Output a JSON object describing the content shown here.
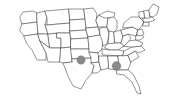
{
  "figure": {
    "kind": "us-state-map",
    "title": "",
    "background_color": "#ffffff",
    "width": 174,
    "height": 103
  },
  "map": {
    "outline_color": "#2e2e2e",
    "state_border_color": "#3a3a3a",
    "state_fill_color": "#ffffff",
    "boundary_style": "state-outlines"
  },
  "markers": [
    {
      "id": "marker-1",
      "name": "oklahoma-marker",
      "label": "",
      "x": 81,
      "y": 60,
      "radius": 4.2,
      "color": "#8a8a8a",
      "shape": "circle"
    },
    {
      "id": "marker-2",
      "name": "alabama-marker",
      "label": "",
      "x": 116.5,
      "y": 66,
      "radius": 4.4,
      "color": "#8a8a8a",
      "shape": "circle"
    }
  ],
  "chart_data": {
    "type": "map",
    "title": "",
    "xlabel": "",
    "ylabel": "",
    "projection": "united-states-lower-48",
    "point_count": 2,
    "points": [
      {
        "region": "Oklahoma",
        "x": 81,
        "y": 60,
        "value": 1
      },
      {
        "region": "Alabama",
        "x": 116.5,
        "y": 66,
        "value": 1
      }
    ],
    "legend": [],
    "grid": false
  }
}
